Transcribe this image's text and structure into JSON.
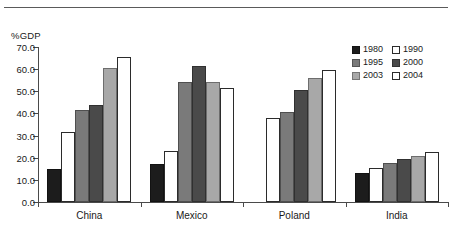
{
  "chart_data": {
    "type": "bar",
    "title": "",
    "subtitle": "",
    "xlabel": "",
    "ylabel": "%GDP",
    "ylim": [
      0.0,
      70.0
    ],
    "ytick_labels": [
      "0.0",
      "10.0",
      "20.0",
      "30.0",
      "40.0",
      "50.0",
      "60.0",
      "70.0"
    ],
    "ytick_values": [
      0.0,
      10.0,
      20.0,
      30.0,
      40.0,
      50.0,
      60.0,
      70.0
    ],
    "grid": false,
    "legend_position": "top-right",
    "categories": [
      "China",
      "Mexico",
      "Poland",
      "India"
    ],
    "series": [
      {
        "name": "1980",
        "color": "#1c1c1c",
        "style": "solid",
        "values": [
          15.0,
          17.0,
          null,
          13.0
        ]
      },
      {
        "name": "1990",
        "color": "#ffffff",
        "style": "hollow",
        "values": [
          31.5,
          23.0,
          38.0,
          15.5
        ]
      },
      {
        "name": "1995",
        "color": "#7a7a7a",
        "style": "solid",
        "values": [
          41.5,
          54.0,
          40.5,
          17.5
        ]
      },
      {
        "name": "2000",
        "color": "#4a4a4a",
        "style": "solid",
        "values": [
          44.0,
          61.5,
          50.5,
          19.5
        ]
      },
      {
        "name": "2003",
        "color": "#a8a8a8",
        "style": "solid",
        "values": [
          60.5,
          54.0,
          56.0,
          21.0
        ]
      },
      {
        "name": "2004",
        "color": "#ffffff",
        "style": "hollow",
        "values": [
          65.5,
          51.5,
          59.5,
          22.5
        ]
      }
    ]
  },
  "legend": {
    "entries": [
      {
        "label": "1980",
        "color": "#1c1c1c",
        "style": "solid"
      },
      {
        "label": "1990",
        "color": "#ffffff",
        "style": "hollow"
      },
      {
        "label": "1995",
        "color": "#7a7a7a",
        "style": "solid"
      },
      {
        "label": "2000",
        "color": "#4a4a4a",
        "style": "solid"
      },
      {
        "label": "2003",
        "color": "#a8a8a8",
        "style": "solid"
      },
      {
        "label": "2004",
        "color": "#ffffff",
        "style": "hollow"
      }
    ]
  }
}
